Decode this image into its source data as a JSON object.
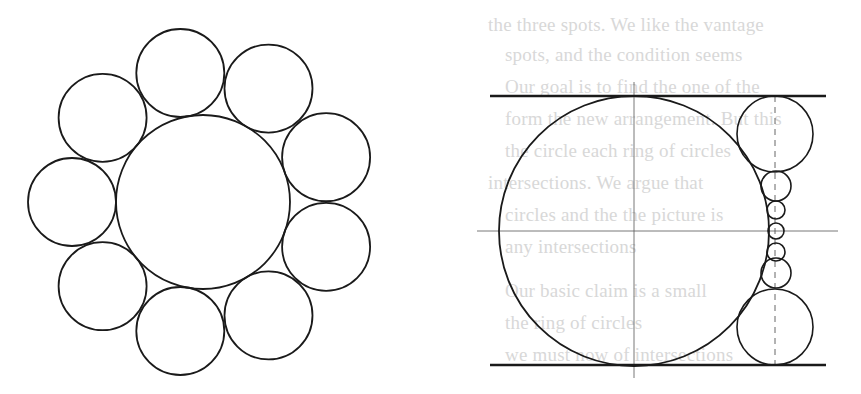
{
  "background_text": {
    "note": "faint show-through from reverse side of page",
    "lines": [
      {
        "x": 488,
        "y": 30,
        "text": "the three spots. We like the vantage"
      },
      {
        "x": 505,
        "y": 60,
        "text": "spots, and the condition seems"
      },
      {
        "x": 505,
        "y": 92,
        "text": "Our goal is to find the one of the"
      },
      {
        "x": 505,
        "y": 124,
        "text": "form the new arrangement. But this"
      },
      {
        "x": 505,
        "y": 156,
        "text": "the circle each ring of circles"
      },
      {
        "x": 488,
        "y": 188,
        "text": "intersections. We argue that"
      },
      {
        "x": 505,
        "y": 220,
        "text": "circles and the the picture is"
      },
      {
        "x": 505,
        "y": 252,
        "text": "any intersections"
      },
      {
        "x": 505,
        "y": 296,
        "text": "Our basic claim is a small"
      },
      {
        "x": 505,
        "y": 328,
        "text": "the ring of circles"
      },
      {
        "x": 505,
        "y": 360,
        "text": "we must now of intersections"
      }
    ]
  },
  "figures": {
    "left": {
      "name": "ring-of-nine-circles",
      "center_circle": {
        "cx": 203,
        "cy": 202,
        "r": 87
      },
      "ring": {
        "count": 9,
        "distance": 131,
        "r": 44,
        "start_angle_deg": 180,
        "step_deg": 40
      }
    },
    "right": {
      "name": "circle-between-parallel-lines",
      "top_line": {
        "x1": 490,
        "y1": 96,
        "x2": 826,
        "y2": 96
      },
      "bottom_line": {
        "x1": 490,
        "y1": 365,
        "x2": 826,
        "y2": 365
      },
      "big_circle": {
        "cx": 634,
        "cy": 231,
        "r": 135
      },
      "h_axis": {
        "x1": 477,
        "y1": 231,
        "x2": 838,
        "y2": 231
      },
      "v_axis": {
        "x1": 634,
        "y1": 82,
        "x2": 634,
        "y2": 378
      },
      "dashed_axis": {
        "x1": 775,
        "y1": 96,
        "x2": 775,
        "y2": 365
      },
      "chain_circles": [
        {
          "cx": 775,
          "cy": 134,
          "r": 38
        },
        {
          "cx": 776,
          "cy": 186,
          "r": 15
        },
        {
          "cx": 776,
          "cy": 210,
          "r": 9
        },
        {
          "cx": 776,
          "cy": 231,
          "r": 8
        },
        {
          "cx": 776,
          "cy": 252,
          "r": 9
        },
        {
          "cx": 776,
          "cy": 273,
          "r": 15
        },
        {
          "cx": 775,
          "cy": 327,
          "r": 38
        }
      ]
    }
  },
  "colors": {
    "stroke": "#1a1a1a",
    "thin_stroke": "#555555",
    "bleed_text": "#d8d8d8"
  }
}
